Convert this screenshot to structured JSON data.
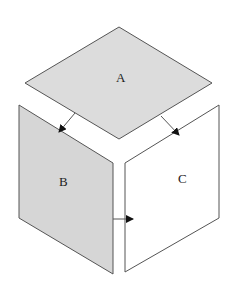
{
  "diagram": {
    "faces": [
      {
        "id": "A",
        "label": "A",
        "fill": "#dcdcdc",
        "points": "119,27 212,83 119,139 25,83",
        "label_x": 116,
        "label_y": 82
      },
      {
        "id": "B",
        "label": "B",
        "fill": "#d6d6d6",
        "points": "19,105 113,163 113,274 19,218",
        "label_x": 59,
        "label_y": 186
      },
      {
        "id": "C",
        "label": "C",
        "fill": "#ffffff",
        "points": "125,163 219,105 219,218 125,272",
        "label_x": 178,
        "label_y": 183
      }
    ],
    "arrows": [
      {
        "from": "A",
        "to": "B",
        "x1": 75,
        "y1": 113,
        "x2": 59,
        "y2": 132
      },
      {
        "from": "A",
        "to": "C",
        "x1": 161,
        "y1": 116,
        "x2": 179,
        "y2": 135
      },
      {
        "from": "B",
        "to": "C",
        "x1": 113,
        "y1": 219,
        "x2": 133,
        "y2": 219
      }
    ],
    "stroke": "#555555"
  }
}
